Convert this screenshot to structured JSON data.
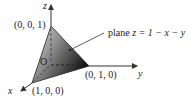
{
  "diagram": {
    "axes": {
      "x_label": "x",
      "y_label": "y",
      "z_label": "z"
    },
    "origin_label": "O",
    "vertices": {
      "z_intercept": "(0, 0, 1)",
      "y_intercept": "(0, 1, 0)",
      "x_intercept": "(1, 0, 0)"
    },
    "annotation": {
      "prefix": "plane ",
      "equation": "z = 1 − x − y"
    },
    "colors": {
      "face_light": "#d8d8d8",
      "face_dark": "#1a1a1a",
      "axis": "#333333",
      "text": "#222222"
    }
  }
}
